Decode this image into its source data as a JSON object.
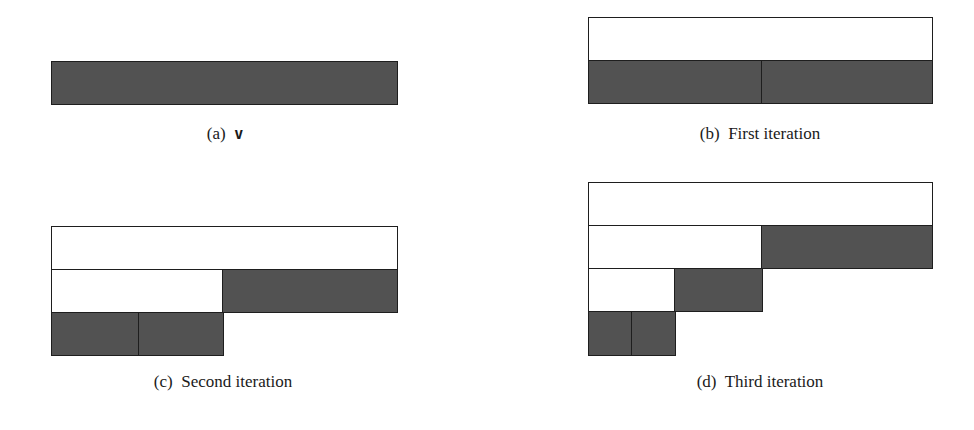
{
  "figure": {
    "colors": {
      "filled": "#525252",
      "empty": "#ffffff",
      "border": "#1e1e1e"
    },
    "panels": [
      {
        "id": "a",
        "label": "(a)",
        "title": "v",
        "rows": [
          {
            "cells": [
              {
                "span": [
                  0,
                  1
                ],
                "fill": "filled"
              }
            ]
          }
        ]
      },
      {
        "id": "b",
        "label": "(b)",
        "title": "First iteration",
        "rows": [
          {
            "cells": [
              {
                "span": [
                  0,
                  1
                ],
                "fill": "empty"
              }
            ]
          },
          {
            "cells": [
              {
                "span": [
                  0,
                  0.5
                ],
                "fill": "filled"
              },
              {
                "span": [
                  0.5,
                  1
                ],
                "fill": "filled"
              }
            ]
          }
        ]
      },
      {
        "id": "c",
        "label": "(c)",
        "title": "Second iteration",
        "rows": [
          {
            "cells": [
              {
                "span": [
                  0,
                  1
                ],
                "fill": "empty"
              }
            ]
          },
          {
            "cells": [
              {
                "span": [
                  0,
                  0.5
                ],
                "fill": "empty"
              },
              {
                "span": [
                  0.5,
                  1
                ],
                "fill": "filled"
              }
            ]
          },
          {
            "cells": [
              {
                "span": [
                  0,
                  0.25
                ],
                "fill": "filled"
              },
              {
                "span": [
                  0.25,
                  0.5
                ],
                "fill": "filled"
              }
            ]
          }
        ]
      },
      {
        "id": "d",
        "label": "(d)",
        "title": "Third iteration",
        "rows": [
          {
            "cells": [
              {
                "span": [
                  0,
                  1
                ],
                "fill": "empty"
              }
            ]
          },
          {
            "cells": [
              {
                "span": [
                  0,
                  0.5
                ],
                "fill": "empty"
              },
              {
                "span": [
                  0.5,
                  1
                ],
                "fill": "filled"
              }
            ]
          },
          {
            "cells": [
              {
                "span": [
                  0,
                  0.25
                ],
                "fill": "empty"
              },
              {
                "span": [
                  0.25,
                  0.5
                ],
                "fill": "filled"
              }
            ]
          },
          {
            "cells": [
              {
                "span": [
                  0,
                  0.125
                ],
                "fill": "filled"
              },
              {
                "span": [
                  0.125,
                  0.25
                ],
                "fill": "filled"
              }
            ]
          }
        ]
      }
    ]
  },
  "captions": {
    "a": {
      "label": "(a)",
      "text": "v"
    },
    "b": {
      "label": "(b)",
      "text": "First iteration"
    },
    "c": {
      "label": "(c)",
      "text": "Second iteration"
    },
    "d": {
      "label": "(d)",
      "text": "Third iteration"
    }
  }
}
